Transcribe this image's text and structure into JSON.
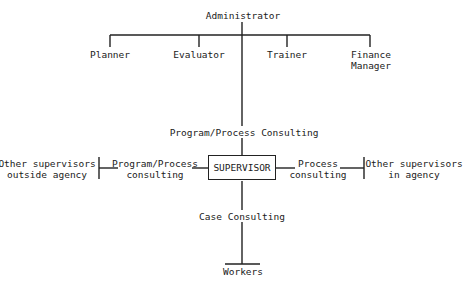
{
  "diagram": {
    "title_node": "Administrator",
    "staff_nodes": [
      {
        "label": "Planner"
      },
      {
        "label": "Evaluator"
      },
      {
        "label": "Trainer"
      },
      {
        "label": "Finance\nManager"
      }
    ],
    "center_node": "SUPERVISOR",
    "edges": {
      "up": "Program/Process Consulting",
      "left": "Program/Process\nconsulting",
      "right": "Process\nconsulting",
      "down": "Case Consulting"
    },
    "left_node": "Other supervisors\noutside agency",
    "right_node": "Other supervisors\nin agency",
    "bottom_node": "Workers",
    "line_color": "#222222"
  }
}
